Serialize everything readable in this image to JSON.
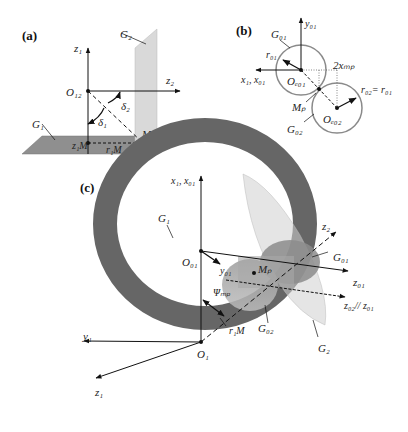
{
  "panels": {
    "a": {
      "tag": "(a)",
      "labels": {
        "g2": "G₂",
        "z1": "z₁",
        "z2": "z₂",
        "o12": "O₁₂",
        "delta2": "δ₂",
        "delta1": "δ₁",
        "g1": "G₁",
        "z1m": "z₁M",
        "r1m": "r₁M",
        "mp": "Mₚ"
      }
    },
    "b": {
      "tag": "(b)",
      "labels": {
        "g01": "G₀₁",
        "y01": "y₀₁",
        "r01": "r₀₁",
        "x1x01": "x₁, x₀₁",
        "o_d01": "Oₑ₀₁",
        "two_x_mp": "2xₘₚ",
        "r02_eq_r01": "r₀₂= r₀₁",
        "mp": "Mₚ",
        "o_d02": "Oₑ₀₂",
        "g02": "G₀₂"
      }
    },
    "c": {
      "tag": "(c)",
      "labels": {
        "x1x01": "x₁, x₀₁",
        "g1": "G₁",
        "o01": "O₀₁",
        "y01": "y₀₁",
        "psi_mp": "Ψₘₚ",
        "z2": "z₂",
        "g01": "G₀₁",
        "mp": "Mₚ",
        "z01": "z₀₁",
        "z02_par_z01": "z₀₂// z₀₁",
        "r1m": "r₁M",
        "g02": "G₀₂",
        "g2": "G₂",
        "y1": "y₁",
        "o1": "O₁",
        "z1": "z₁"
      }
    }
  },
  "colors": {
    "plane_g1": "#8f8f8f",
    "plane_g2": "#d9d9d9",
    "ring": "#6b6b6b",
    "circle_stroke": "#8a8a8a",
    "line": "#111111"
  }
}
